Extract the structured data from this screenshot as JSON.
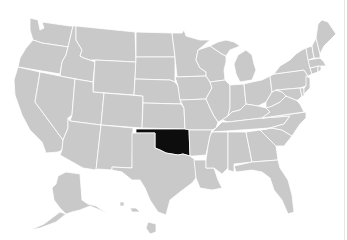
{
  "map": {
    "title": "United States map highlighting Oklahoma",
    "highlighted_state": "Oklahoma",
    "colors": {
      "land": "#c9c9c9",
      "border": "#ffffff",
      "highlight": "#0d0d0d",
      "background": "#ffffff"
    },
    "states": [
      {
        "name": "Washington",
        "highlighted": false
      },
      {
        "name": "Oregon",
        "highlighted": false
      },
      {
        "name": "California",
        "highlighted": false
      },
      {
        "name": "Idaho",
        "highlighted": false
      },
      {
        "name": "Nevada",
        "highlighted": false
      },
      {
        "name": "Montana",
        "highlighted": false
      },
      {
        "name": "Wyoming",
        "highlighted": false
      },
      {
        "name": "Utah",
        "highlighted": false
      },
      {
        "name": "Arizona",
        "highlighted": false
      },
      {
        "name": "Colorado",
        "highlighted": false
      },
      {
        "name": "New Mexico",
        "highlighted": false
      },
      {
        "name": "North Dakota",
        "highlighted": false
      },
      {
        "name": "South Dakota",
        "highlighted": false
      },
      {
        "name": "Nebraska",
        "highlighted": false
      },
      {
        "name": "Kansas",
        "highlighted": false
      },
      {
        "name": "Oklahoma",
        "highlighted": true
      },
      {
        "name": "Texas",
        "highlighted": false
      },
      {
        "name": "Minnesota",
        "highlighted": false
      },
      {
        "name": "Iowa",
        "highlighted": false
      },
      {
        "name": "Missouri",
        "highlighted": false
      },
      {
        "name": "Arkansas",
        "highlighted": false
      },
      {
        "name": "Louisiana",
        "highlighted": false
      },
      {
        "name": "Wisconsin",
        "highlighted": false
      },
      {
        "name": "Illinois",
        "highlighted": false
      },
      {
        "name": "Michigan",
        "highlighted": false
      },
      {
        "name": "Indiana",
        "highlighted": false
      },
      {
        "name": "Ohio",
        "highlighted": false
      },
      {
        "name": "Kentucky",
        "highlighted": false
      },
      {
        "name": "Tennessee",
        "highlighted": false
      },
      {
        "name": "Mississippi",
        "highlighted": false
      },
      {
        "name": "Alabama",
        "highlighted": false
      },
      {
        "name": "Georgia",
        "highlighted": false
      },
      {
        "name": "Florida",
        "highlighted": false
      },
      {
        "name": "South Carolina",
        "highlighted": false
      },
      {
        "name": "North Carolina",
        "highlighted": false
      },
      {
        "name": "Virginia",
        "highlighted": false
      },
      {
        "name": "West Virginia",
        "highlighted": false
      },
      {
        "name": "Pennsylvania",
        "highlighted": false
      },
      {
        "name": "New York",
        "highlighted": false
      },
      {
        "name": "Maryland",
        "highlighted": false
      },
      {
        "name": "Delaware",
        "highlighted": false
      },
      {
        "name": "New Jersey",
        "highlighted": false
      },
      {
        "name": "Connecticut",
        "highlighted": false
      },
      {
        "name": "Rhode Island",
        "highlighted": false
      },
      {
        "name": "Massachusetts",
        "highlighted": false
      },
      {
        "name": "Vermont",
        "highlighted": false
      },
      {
        "name": "New Hampshire",
        "highlighted": false
      },
      {
        "name": "Maine",
        "highlighted": false
      },
      {
        "name": "Alaska",
        "highlighted": false
      },
      {
        "name": "Hawaii",
        "highlighted": false
      }
    ]
  }
}
